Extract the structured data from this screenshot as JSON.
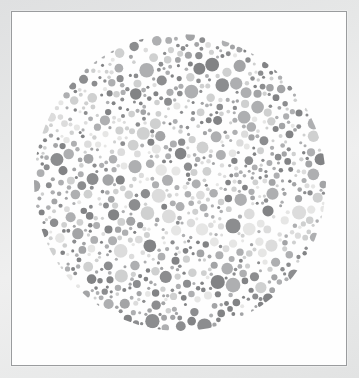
{
  "image": {
    "kind": "ishihara-plate-photo",
    "title": "Ishihara color vision test plate",
    "description": "Desaturated photograph of a printed Ishihara pseudoisochromatic plate on white card stock",
    "alt_text": "Circular mosaic of many small grayscale dots of varying size forming a hidden numeral"
  },
  "paper": {
    "background_color": "#e4e5e5",
    "card_color": "#fdfdfd",
    "border_color": "#9a9c9e",
    "border_width_px": 1,
    "card_left_px": 11,
    "card_top_px": 11,
    "card_width_px": 336,
    "card_height_px": 355
  },
  "disc": {
    "name": "dot-mosaic-disc",
    "center_x_px": 179,
    "center_y_px": 181,
    "diameter_px": 294,
    "background_color": "#fefefe"
  },
  "palette": {
    "dark_gray": "#828385",
    "dark_gray_alt": "#8c8d8f",
    "mid_gray": "#a3a4a6",
    "mid_gray_alt": "#aeafb1",
    "light_gray": "#cfd0d0",
    "light_gray_alt": "#dcdcdc",
    "pale_gray": "#e6e6e5",
    "background_white": "#fdfdfd"
  },
  "chart_data": {
    "type": "scatter",
    "xlabel": "",
    "ylabel": "",
    "xlim": [
      0,
      292
    ],
    "ylim": [
      0,
      297
    ],
    "grid": false,
    "legend": "none",
    "tone_groups": [
      {
        "name": "dark",
        "color": "#868789",
        "share_percent": 34
      },
      {
        "name": "medium",
        "color": "#a8a9ab",
        "share_percent": 33
      },
      {
        "name": "light",
        "color": "#d6d7d7",
        "share_percent": 33
      }
    ],
    "dot_radius_range_px": [
      1.5,
      7.5
    ],
    "approx_dot_count": 900
  },
  "accessibility": {
    "role": "img",
    "long_description": "A large circle densely filled with small circles of three gray tones and many sizes; the tonal arrangement encodes a figure readable only under normal color vision."
  }
}
